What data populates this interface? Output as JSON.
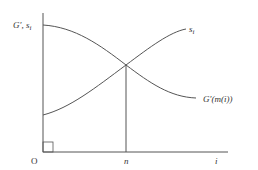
{
  "diagram": {
    "y_axis_label": "G′, s",
    "y_axis_label_sub": "i",
    "x_axis_label": "i",
    "origin_label": "O",
    "marker_label": "n",
    "curves": [
      {
        "name": "s",
        "sub": "i",
        "description": "increasing curve"
      },
      {
        "name": "G′(m(i))",
        "description": "decreasing curve"
      }
    ],
    "colors": {
      "line": "#555555",
      "text": "#333333"
    }
  }
}
